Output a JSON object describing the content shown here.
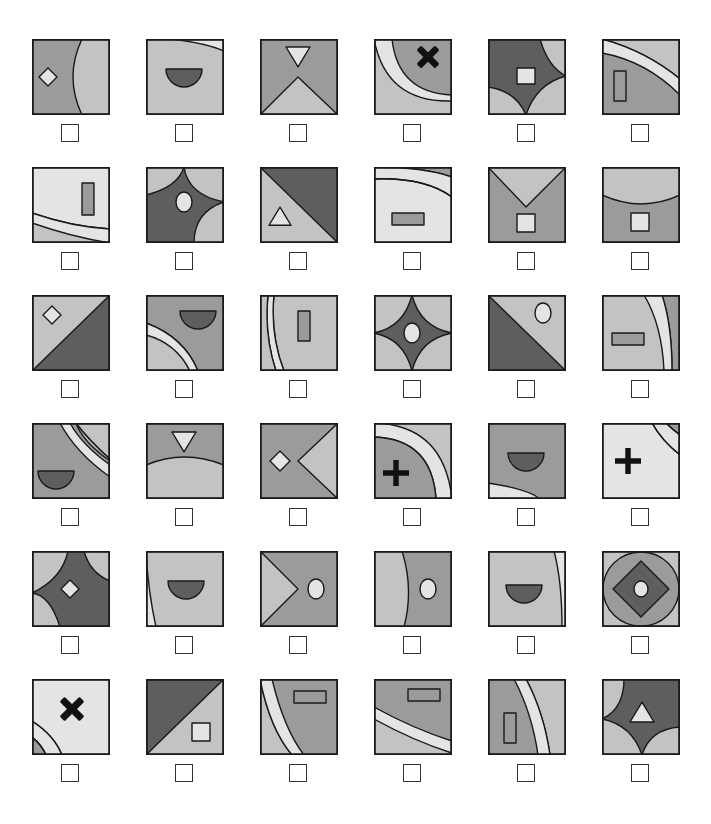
{
  "puzzle": {
    "colors": {
      "dark": "#5e5e5e",
      "medium": "#9b9b9b",
      "light": "#c3c3c3",
      "pale": "#e4e4e4",
      "black": "#111111",
      "stroke": "#1a1a1a"
    },
    "grid": {
      "columns": 6,
      "rows": 6,
      "col_x": [
        32,
        146,
        260,
        374,
        488,
        602
      ],
      "row_y": [
        39,
        167,
        295,
        423,
        551,
        679
      ]
    },
    "tiles": [
      {
        "id": "r1c1",
        "checked": false,
        "bg": "medium",
        "shapes": [
          {
            "type": "path",
            "fill": "light",
            "d": "M50 0 Q32 38 50 76 L78 76 L78 0 Z"
          },
          {
            "type": "diamond",
            "fill": "pale",
            "cx": 16,
            "cy": 38,
            "r": 9
          }
        ]
      },
      {
        "id": "r2c1_top",
        "checked": false,
        "bg": "light",
        "shapes": [
          {
            "type": "path",
            "fill": "pale",
            "d": "M25 0 Q60 4 78 12 L78 0 Z"
          },
          {
            "type": "halfdisc",
            "fill": "dark",
            "cx": 38,
            "cy": 30,
            "r": 18
          }
        ]
      },
      {
        "id": "r1c3",
        "checked": false,
        "bg": "medium",
        "shapes": [
          {
            "type": "path",
            "fill": "light",
            "d": "M0 76 L38 38 L78 76 Z"
          },
          {
            "type": "tri_down",
            "fill": "pale",
            "cx": 38,
            "cy": 17,
            "r": 12
          }
        ]
      },
      {
        "id": "r1c4",
        "checked": false,
        "bg": "light",
        "shapes": [
          {
            "type": "path",
            "fill": "pale",
            "d": "M0 0 L78 0 L78 62 Q12 64 0 0 Z"
          },
          {
            "type": "path",
            "fill": "medium",
            "d": "M18 0 L78 0 L78 56 Q24 54 18 0 Z"
          },
          {
            "type": "cross_x",
            "fill": "black",
            "cx": 54,
            "cy": 18,
            "r": 13
          }
        ]
      },
      {
        "id": "r1c5",
        "checked": false,
        "bg": "light",
        "shapes": [
          {
            "type": "path",
            "fill": "dark",
            "d": "M0 0 L52 0 Q60 28 78 37 Q48 45 38 76 Q28 52 0 48 Z"
          },
          {
            "type": "rect",
            "fill": "pale",
            "x": 29,
            "y": 29,
            "w": 18,
            "h": 16
          }
        ]
      },
      {
        "id": "r1c6",
        "checked": false,
        "bg": "medium",
        "shapes": [
          {
            "type": "path",
            "fill": "light",
            "d": "M0 0 L78 0 L78 40 Q44 12 0 0 Z"
          },
          {
            "type": "path",
            "fill": "pale",
            "d": "M0 0 Q44 12 78 40 L78 56 Q44 22 0 14 Z"
          },
          {
            "type": "rect",
            "fill": "medium",
            "x": 12,
            "y": 32,
            "w": 12,
            "h": 30
          }
        ]
      },
      {
        "id": "r2c1",
        "checked": false,
        "bg": "pale",
        "shapes": [
          {
            "type": "path",
            "fill": "light",
            "d": "M0 46 Q40 60 78 62 L78 76 L0 76 Z"
          },
          {
            "type": "path",
            "fill": "pale",
            "d": "M0 56 Q40 70 78 76 L78 62 Q40 60 0 46 Z"
          },
          {
            "type": "rect",
            "fill": "medium",
            "x": 50,
            "y": 16,
            "w": 12,
            "h": 32
          }
        ]
      },
      {
        "id": "r2c2",
        "checked": false,
        "bg": "light",
        "shapes": [
          {
            "type": "path",
            "fill": "dark",
            "d": "M0 28 Q32 20 38 0 Q42 28 78 35 Q48 45 48 76 L0 76 Z"
          },
          {
            "type": "ellipse",
            "fill": "pale",
            "cx": 38,
            "cy": 35,
            "rx": 8,
            "ry": 10
          }
        ]
      },
      {
        "id": "r2c3",
        "checked": false,
        "bg": "dark",
        "shapes": [
          {
            "type": "path",
            "fill": "light",
            "d": "M0 0 L78 76 L0 76 Z"
          },
          {
            "type": "tri_up",
            "fill": "pale",
            "cx": 20,
            "cy": 50,
            "r": 11
          }
        ]
      },
      {
        "id": "r2c4",
        "checked": false,
        "bg": "pale",
        "shapes": [
          {
            "type": "path",
            "fill": "medium",
            "d": "M0 0 L78 0 L78 10 Q50 0 0 0 Z"
          },
          {
            "type": "path",
            "fill": "pale",
            "d": "M0 0 Q50 0 78 10 L78 30 Q50 10 0 12 Z"
          },
          {
            "type": "path",
            "fill": "none",
            "d": "M0 12 Q50 10 78 30"
          },
          {
            "type": "rect",
            "fill": "medium",
            "x": 18,
            "y": 46,
            "w": 32,
            "h": 12
          }
        ]
      },
      {
        "id": "r2c5",
        "checked": false,
        "bg": "medium",
        "shapes": [
          {
            "type": "path",
            "fill": "light",
            "d": "M0 0 L78 0 L38 40 Z"
          },
          {
            "type": "rect",
            "fill": "pale",
            "x": 29,
            "y": 47,
            "w": 18,
            "h": 18
          }
        ]
      },
      {
        "id": "r2c6",
        "checked": false,
        "bg": "medium",
        "shapes": [
          {
            "type": "path",
            "fill": "light",
            "d": "M0 0 L78 0 L78 28 Q40 46 0 28 Z"
          },
          {
            "type": "rect",
            "fill": "pale",
            "x": 29,
            "y": 46,
            "w": 18,
            "h": 18
          }
        ]
      },
      {
        "id": "r3c1",
        "checked": false,
        "bg": "light",
        "shapes": [
          {
            "type": "path",
            "fill": "dark",
            "d": "M78 0 L78 76 L0 76 Z"
          },
          {
            "type": "diamond",
            "fill": "pale",
            "cx": 20,
            "cy": 20,
            "r": 9
          }
        ]
      },
      {
        "id": "r3c2",
        "checked": false,
        "bg": "medium",
        "shapes": [
          {
            "type": "path",
            "fill": "light",
            "d": "M0 28 Q38 42 52 76 L0 76 Z"
          },
          {
            "type": "path",
            "fill": "pale",
            "d": "M0 28 Q38 42 52 76 L44 76 Q30 48 0 40 Z"
          },
          {
            "type": "halfdisc",
            "fill": "dark",
            "cx": 52,
            "cy": 16,
            "r": 18
          }
        ]
      },
      {
        "id": "r3c3",
        "checked": false,
        "bg": "pale",
        "shapes": [
          {
            "type": "path",
            "fill": "light",
            "d": "M0 0 L78 0 L78 76 L24 76 Q10 40 14 0 Z"
          },
          {
            "type": "path",
            "fill": "pale",
            "d": "M8 0 Q4 40 16 76 L24 76 Q10 40 14 0 Z"
          },
          {
            "type": "path",
            "fill": "light",
            "d": "M0 0 L8 0 Q4 40 16 76 L0 76 Z"
          },
          {
            "type": "rect",
            "fill": "medium",
            "x": 38,
            "y": 16,
            "w": 12,
            "h": 30
          }
        ]
      },
      {
        "id": "r3c4",
        "checked": false,
        "bg": "light",
        "shapes": [
          {
            "type": "path",
            "fill": "dark",
            "d": "M0 38 Q30 32 38 0 Q46 32 78 38 Q46 44 38 76 Q30 44 0 38 Z"
          },
          {
            "type": "ellipse",
            "fill": "pale",
            "cx": 38,
            "cy": 38,
            "rx": 8,
            "ry": 10
          }
        ]
      },
      {
        "id": "r3c5",
        "checked": false,
        "bg": "light",
        "shapes": [
          {
            "type": "path",
            "fill": "dark",
            "d": "M0 0 L78 76 L0 76 Z"
          },
          {
            "type": "ellipse",
            "fill": "pale",
            "cx": 55,
            "cy": 18,
            "rx": 8,
            "ry": 10
          }
        ]
      },
      {
        "id": "r3c6",
        "checked": false,
        "bg": "light",
        "shapes": [
          {
            "type": "path",
            "fill": "medium",
            "d": "M60 0 L78 0 L78 76 L70 76 Q70 30 60 0 Z"
          },
          {
            "type": "path",
            "fill": "pale",
            "d": "M42 0 L60 0 Q70 30 70 76 L62 76 Q60 30 42 0 Z"
          },
          {
            "type": "rect",
            "fill": "medium",
            "x": 10,
            "y": 38,
            "w": 32,
            "h": 12
          }
        ]
      },
      {
        "id": "r4c1",
        "checked": false,
        "bg": "medium",
        "shapes": [
          {
            "type": "path",
            "fill": "light",
            "d": "M38 0 L78 0 L78 38 Q50 18 44 0 Z"
          },
          {
            "type": "path",
            "fill": "pale",
            "d": "M28 0 L38 0 Q50 22 78 42 L78 54 Q44 30 28 0 Z"
          },
          {
            "type": "path",
            "fill": "medium",
            "d": "M44 0 L78 0 L78 36 Q56 16 44 0 Z"
          },
          {
            "type": "path",
            "fill": "light",
            "d": "M44 0 L78 0 L78 36 Q56 16 44 0 Z"
          },
          {
            "type": "halfdisc",
            "fill": "dark",
            "cx": 24,
            "cy": 48,
            "r": 18
          }
        ]
      },
      {
        "id": "r4c2",
        "checked": false,
        "bg": "medium",
        "shapes": [
          {
            "type": "path",
            "fill": "light",
            "d": "M0 42 Q38 26 78 42 L78 76 L0 76 Z"
          },
          {
            "type": "tri_down",
            "fill": "pale",
            "cx": 38,
            "cy": 18,
            "r": 12
          }
        ]
      },
      {
        "id": "r4c3",
        "checked": false,
        "bg": "medium",
        "shapes": [
          {
            "type": "path",
            "fill": "light",
            "d": "M78 0 L38 38 L78 76 Z"
          },
          {
            "type": "diamond",
            "fill": "pale",
            "cx": 20,
            "cy": 38,
            "r": 10
          }
        ]
      },
      {
        "id": "r4c4",
        "checked": false,
        "bg": "light",
        "shapes": [
          {
            "type": "path",
            "fill": "pale",
            "d": "M0 0 Q70 2 78 76 L62 76 Q58 16 0 14 Z"
          },
          {
            "type": "path",
            "fill": "medium",
            "d": "M0 14 Q58 16 62 76 L0 76 Z"
          },
          {
            "type": "cross_plus",
            "fill": "black",
            "cx": 22,
            "cy": 50,
            "r": 13
          }
        ]
      },
      {
        "id": "r4c5",
        "checked": false,
        "bg": "medium",
        "shapes": [
          {
            "type": "path",
            "fill": "pale",
            "d": "M0 60 Q40 66 52 76 L0 76 Z"
          },
          {
            "type": "halfdisc",
            "fill": "dark",
            "cx": 38,
            "cy": 30,
            "r": 18
          }
        ]
      },
      {
        "id": "r4c6",
        "checked": false,
        "bg": "pale",
        "shapes": [
          {
            "type": "path",
            "fill": "pale",
            "d": "M50 0 L78 0 L78 32 Q60 18 50 0 Z"
          },
          {
            "type": "path",
            "fill": "medium",
            "d": "M64 0 L78 0 L78 12 Q70 6 64 0 Z"
          },
          {
            "type": "path",
            "fill": "none",
            "d": "M50 0 Q60 18 78 32"
          },
          {
            "type": "path",
            "fill": "none",
            "d": "M64 0 Q70 6 78 12"
          },
          {
            "type": "cross_plus",
            "fill": "black",
            "cx": 26,
            "cy": 38,
            "r": 13
          }
        ]
      },
      {
        "id": "r5c1",
        "checked": false,
        "bg": "light",
        "shapes": [
          {
            "type": "path",
            "fill": "dark",
            "d": "M36 0 L78 0 L78 76 L28 76 Q18 44 0 42 Q30 28 36 0 Z"
          },
          {
            "type": "path",
            "fill": "light",
            "d": "M52 0 L78 0 L78 30 Q58 22 52 0 Z"
          },
          {
            "type": "diamond",
            "fill": "pale",
            "cx": 38,
            "cy": 38,
            "r": 9
          }
        ]
      },
      {
        "id": "r5c2",
        "checked": false,
        "bg": "light",
        "shapes": [
          {
            "type": "path",
            "fill": "pale",
            "d": "M0 0 Q2 40 10 76 L0 76 Z"
          },
          {
            "type": "halfdisc",
            "fill": "dark",
            "cx": 40,
            "cy": 30,
            "r": 18
          }
        ]
      },
      {
        "id": "r5c3",
        "checked": false,
        "bg": "medium",
        "shapes": [
          {
            "type": "path",
            "fill": "light",
            "d": "M0 0 L38 38 L0 76 Z"
          },
          {
            "type": "ellipse",
            "fill": "pale",
            "cx": 56,
            "cy": 38,
            "rx": 8,
            "ry": 10
          }
        ]
      },
      {
        "id": "r5c4",
        "checked": false,
        "bg": "medium",
        "shapes": [
          {
            "type": "path",
            "fill": "light",
            "d": "M0 0 L28 0 Q40 38 30 76 L0 76 Z"
          },
          {
            "type": "ellipse",
            "fill": "pale",
            "cx": 54,
            "cy": 38,
            "rx": 8,
            "ry": 10
          }
        ]
      },
      {
        "id": "r5c5",
        "checked": false,
        "bg": "light",
        "shapes": [
          {
            "type": "path",
            "fill": "pale",
            "d": "M66 0 L78 0 L78 76 L74 76 Q74 30 66 0 Z"
          },
          {
            "type": "halfdisc",
            "fill": "dark",
            "cx": 36,
            "cy": 34,
            "r": 18
          }
        ]
      },
      {
        "id": "r5c6",
        "checked": false,
        "bg": "light",
        "shapes": [
          {
            "type": "ellipse",
            "fill": "medium",
            "cx": 39,
            "cy": 38,
            "rx": 38,
            "ry": 37
          },
          {
            "type": "diamond",
            "fill": "dark",
            "cx": 39,
            "cy": 38,
            "r": 28
          },
          {
            "type": "ellipse",
            "fill": "pale",
            "cx": 39,
            "cy": 38,
            "rx": 7,
            "ry": 8
          }
        ]
      },
      {
        "id": "r6c1",
        "checked": false,
        "bg": "pale",
        "shapes": [
          {
            "type": "path",
            "fill": "pale",
            "d": "M0 42 Q22 56 30 76 L0 76 Z"
          },
          {
            "type": "path",
            "fill": "medium",
            "d": "M0 58 Q10 66 14 76 L0 76 Z"
          },
          {
            "type": "path",
            "fill": "none",
            "d": "M0 42 Q22 56 30 76"
          },
          {
            "type": "path",
            "fill": "none",
            "d": "M0 58 Q10 66 14 76"
          },
          {
            "type": "cross_x",
            "fill": "black",
            "cx": 40,
            "cy": 30,
            "r": 14
          }
        ]
      },
      {
        "id": "r6c2",
        "checked": false,
        "bg": "light",
        "shapes": [
          {
            "type": "path",
            "fill": "dark",
            "d": "M0 0 L78 0 L0 76 Z"
          },
          {
            "type": "rect",
            "fill": "pale",
            "x": 46,
            "y": 44,
            "w": 18,
            "h": 18
          }
        ]
      },
      {
        "id": "r6c3",
        "checked": false,
        "bg": "medium",
        "shapes": [
          {
            "type": "path",
            "fill": "light",
            "d": "M0 0 Q10 50 32 76 L0 76 Z"
          },
          {
            "type": "path",
            "fill": "pale",
            "d": "M0 0 L12 0 Q24 50 44 76 L32 76 Q10 50 0 0 Z"
          },
          {
            "type": "rect",
            "fill": "medium",
            "x": 34,
            "y": 12,
            "w": 32,
            "h": 12
          }
        ]
      },
      {
        "id": "r6c4",
        "checked": false,
        "bg": "medium",
        "shapes": [
          {
            "type": "path",
            "fill": "light",
            "d": "M0 38 Q40 60 78 74 L78 76 L0 76 Z"
          },
          {
            "type": "path",
            "fill": "pale",
            "d": "M0 28 Q40 50 78 62 L78 74 Q40 62 0 40 Z"
          },
          {
            "type": "rect",
            "fill": "medium",
            "x": 34,
            "y": 10,
            "w": 32,
            "h": 12
          }
        ]
      },
      {
        "id": "r6c5",
        "checked": false,
        "bg": "medium",
        "shapes": [
          {
            "type": "path",
            "fill": "light",
            "d": "M38 0 L78 0 L78 76 L62 76 Q56 34 38 0 Z"
          },
          {
            "type": "path",
            "fill": "pale",
            "d": "M26 0 L38 0 Q56 34 62 76 L50 76 Q44 34 26 0 Z"
          },
          {
            "type": "rect",
            "fill": "medium",
            "x": 16,
            "y": 34,
            "w": 12,
            "h": 30
          }
        ]
      },
      {
        "id": "r6c6",
        "checked": false,
        "bg": "light",
        "shapes": [
          {
            "type": "path",
            "fill": "dark",
            "d": "M22 0 L78 0 L78 48 Q48 50 40 76 Q30 46 0 40 Q22 30 22 0 Z"
          },
          {
            "type": "tri_up",
            "fill": "pale",
            "cx": 40,
            "cy": 34,
            "r": 12
          }
        ]
      }
    ]
  }
}
